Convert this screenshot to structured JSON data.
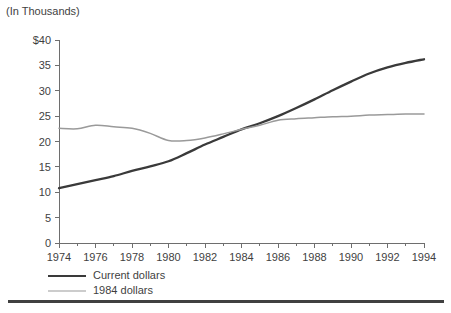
{
  "caption": "(In Thousands)",
  "legend": {
    "items": [
      {
        "label": "Current dollars",
        "color": "#3a3a3a",
        "width": 2.4
      },
      {
        "label": "1984 dollars",
        "color": "#9a9a9a",
        "width": 1.6
      }
    ]
  },
  "axes": {
    "y_tick_labels": [
      "$40",
      "35",
      "30",
      "25",
      "20",
      "15",
      "10",
      "5",
      "0"
    ],
    "x_tick_labels": [
      "1974",
      "1976",
      "1978",
      "1980",
      "1982",
      "1984",
      "1986",
      "1988",
      "1990",
      "1992",
      "1994"
    ]
  },
  "chart_data": {
    "type": "line",
    "title": "(In Thousands)",
    "xlabel": "",
    "ylabel": "",
    "xlim": [
      1974,
      1994
    ],
    "ylim": [
      0,
      40
    ],
    "y_ticks": [
      0,
      5,
      10,
      15,
      20,
      25,
      30,
      35,
      40
    ],
    "y_tick_labels": [
      "0",
      "5",
      "10",
      "15",
      "20",
      "25",
      "30",
      "35",
      "$40"
    ],
    "x_ticks": [
      1974,
      1976,
      1978,
      1980,
      1982,
      1984,
      1986,
      1988,
      1990,
      1992,
      1994
    ],
    "x_minor_ticks": [
      1975,
      1977,
      1979,
      1981,
      1983,
      1985,
      1987,
      1989,
      1991,
      1993
    ],
    "grid": false,
    "legend_position": "below-axis-left",
    "x": [
      1974,
      1975,
      1976,
      1977,
      1978,
      1979,
      1980,
      1981,
      1982,
      1983,
      1984,
      1985,
      1986,
      1987,
      1988,
      1989,
      1990,
      1991,
      1992,
      1993,
      1994
    ],
    "series": [
      {
        "name": "Current dollars",
        "color": "#3a3a3a",
        "values": [
          10.8,
          11.6,
          12.4,
          13.2,
          14.2,
          15.1,
          16.1,
          17.7,
          19.4,
          20.9,
          22.4,
          23.6,
          25.0,
          26.6,
          28.3,
          30.1,
          31.8,
          33.4,
          34.6,
          35.5,
          36.2
        ]
      },
      {
        "name": "1984 dollars",
        "color": "#9a9a9a",
        "values": [
          22.6,
          22.5,
          23.2,
          22.9,
          22.6,
          21.6,
          20.2,
          20.2,
          20.7,
          21.5,
          22.4,
          23.2,
          24.2,
          24.5,
          24.7,
          24.9,
          25.0,
          25.2,
          25.3,
          25.4,
          25.4
        ]
      }
    ]
  }
}
